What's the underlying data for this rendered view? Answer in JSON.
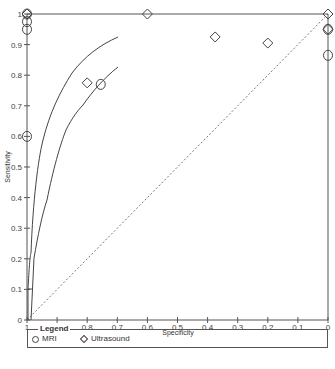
{
  "chart_data": {
    "type": "scatter",
    "title": "",
    "xlabel": "Specificity",
    "ylabel": "Sensitivity",
    "x_reversed": true,
    "xlim": [
      1,
      0
    ],
    "ylim": [
      0,
      1
    ],
    "x_ticks": [
      "1",
      "0.9",
      "0.8",
      "0.7",
      "0.6",
      "0.5",
      "0.4",
      "0.3",
      "0.2",
      "0.1",
      "0"
    ],
    "y_ticks": [
      "0",
      "0.1",
      "0.2",
      "0.3",
      "0.4",
      "0.5",
      "0.6",
      "0.7",
      "0.8",
      "0.9",
      "1"
    ],
    "grid": false,
    "legend_position": "bottom",
    "series": [
      {
        "name": "MRI",
        "marker": "circle",
        "points": [
          {
            "specificity": 1.0,
            "sensitivity": 1.0
          },
          {
            "specificity": 1.0,
            "sensitivity": 0.975
          },
          {
            "specificity": 1.0,
            "sensitivity": 0.95
          },
          {
            "specificity": 1.0,
            "sensitivity": 0.6
          },
          {
            "specificity": 0.755,
            "sensitivity": 0.77
          },
          {
            "specificity": 0.0,
            "sensitivity": 0.95
          },
          {
            "specificity": 0.0,
            "sensitivity": 0.865
          }
        ]
      },
      {
        "name": "Ultrasound",
        "marker": "diamond",
        "points": [
          {
            "specificity": 1.0,
            "sensitivity": 1.0
          },
          {
            "specificity": 0.6,
            "sensitivity": 1.0
          },
          {
            "specificity": 0.375,
            "sensitivity": 0.925
          },
          {
            "specificity": 0.2,
            "sensitivity": 0.905
          },
          {
            "specificity": 0.8,
            "sensitivity": 0.775
          },
          {
            "specificity": 0.0,
            "sensitivity": 1.0
          },
          {
            "specificity": 0.0,
            "sensitivity": 0.95
          }
        ]
      }
    ],
    "curves": [
      {
        "name": "MRI SROC curve",
        "style": "solid"
      },
      {
        "name": "Ultrasound SROC curve",
        "style": "solid"
      },
      {
        "name": "Line of no discrimination",
        "style": "dashed"
      }
    ]
  },
  "legend": {
    "title": "Legend",
    "items": [
      {
        "label": "MRI",
        "marker": "circle"
      },
      {
        "label": "Ultrasound",
        "marker": "diamond"
      }
    ]
  },
  "axes": {
    "x_title": "Specificity",
    "y_title": "Sensitivity"
  }
}
